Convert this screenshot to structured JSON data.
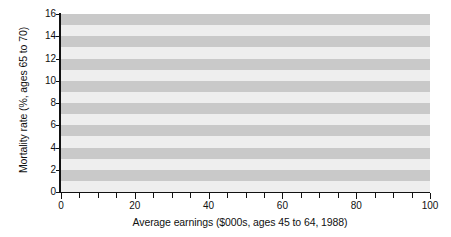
{
  "chart_data": {
    "type": "line",
    "title": "",
    "subtitle": "",
    "xlabel": "Average earnings ($000s, ages 45 to 64, 1988)",
    "ylabel": "Mortality rate (%, ages 65 to 70)",
    "xlim": [
      0,
      100
    ],
    "ylim": [
      0,
      16
    ],
    "x_ticks_major": [
      0,
      20,
      40,
      60,
      80,
      100
    ],
    "x_tick_labels": [
      "0",
      "20",
      "40",
      "60",
      "80",
      "100"
    ],
    "x_ticks_minor": [
      5,
      10,
      15,
      25,
      30,
      35,
      45,
      50,
      55,
      65,
      70,
      75,
      85,
      90,
      95
    ],
    "y_ticks": [
      0,
      2,
      4,
      6,
      8,
      10,
      12,
      14,
      16
    ],
    "y_tick_labels": [
      "0",
      "2",
      "4",
      "6",
      "8",
      "10",
      "12",
      "14",
      "16"
    ],
    "grid": "horizontal-alternating-bands",
    "band_interval": 1,
    "legend": "none",
    "annotations": [],
    "series": [
      {
        "name": "Mortality rate",
        "color": "#111111",
        "line_width": 2,
        "x": [
          0,
          5,
          10,
          15,
          20,
          25,
          30,
          35,
          40,
          48,
          52,
          57,
          62,
          73,
          78,
          85,
          100
        ],
        "values": [
          12.3,
          12.3,
          15.4,
          13.1,
          12.9,
          12.0,
          11.0,
          11.0,
          10.0,
          10.0,
          9.6,
          8.0,
          8.0,
          8.0,
          7.8,
          7.8,
          7.8
        ]
      }
    ]
  },
  "figure": {
    "background_color": "#ffffff",
    "plot_background_light": "#eeeeee",
    "plot_background_dark": "#c9c9c9",
    "axis_color": "#111111"
  }
}
